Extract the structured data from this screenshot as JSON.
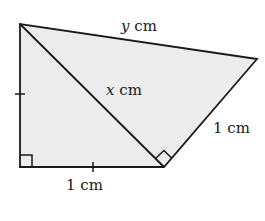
{
  "diagram": {
    "colors": {
      "fill": "#ececec",
      "stroke": "#1a1a1a",
      "background": "#ffffff"
    },
    "vertices": {
      "top_left": [
        20,
        24
      ],
      "bottom_left": [
        20,
        167
      ],
      "bottom_right": [
        164,
        167
      ],
      "right": [
        257,
        59
      ]
    },
    "labels": {
      "top_edge": {
        "var": "y",
        "unit": " cm"
      },
      "diagonal": {
        "var": "x",
        "unit": " cm"
      },
      "right_edge": {
        "text": "1 cm"
      },
      "bottom_edge": {
        "text": "1 cm"
      }
    },
    "markings": {
      "right_angles": [
        "bottom_left",
        "bottom_right"
      ],
      "equal_ticks": [
        "left_edge",
        "bottom_edge"
      ]
    }
  }
}
